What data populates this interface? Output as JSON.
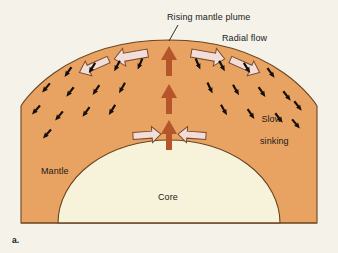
{
  "figure": {
    "panel_label": "a.",
    "background_color": "#f4f2e9"
  },
  "labels": {
    "rising_plume": "Rising mantle plume",
    "radial_flow": "Radial flow",
    "slow_sinking_line1": "Slow",
    "slow_sinking_line2": "sinking",
    "mantle": "Mantle",
    "core": "Core"
  },
  "layers": {
    "mantle": {
      "name": "Mantle",
      "fill_color": "#e8a262",
      "outline_color": "#6b4420"
    },
    "core": {
      "name": "Core",
      "fill_color": "#f6f3da",
      "outline_color": "#6b4420"
    }
  },
  "flow": {
    "plume_arrow_color": "#b5562a",
    "radial_arrow_fill": "#f3ddd8",
    "radial_arrow_stroke": "#7a4a2c",
    "sinking_arrow_color": "#15100c",
    "plume_arrow_count": 3,
    "radial_arrow_count_top": 4,
    "radial_arrow_count_bottom": 2,
    "sinking_arrow_count": 26
  }
}
